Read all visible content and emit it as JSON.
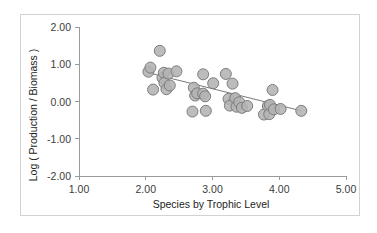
{
  "chart_data": {
    "type": "scatter",
    "title": "",
    "xlabel": "Species by Trophic Level",
    "ylabel": "Log ( Production / Biomass )",
    "xlim": [
      1.0,
      5.0
    ],
    "ylim": [
      -2.0,
      2.0
    ],
    "xticks": [
      "1.00",
      "2.00",
      "3.00",
      "4.00",
      "5.00"
    ],
    "xtick_values": [
      1.0,
      2.0,
      3.0,
      4.0,
      5.0
    ],
    "yticks": [
      "2.00",
      "1.00",
      "0.00",
      "-1.00",
      "-2.00"
    ],
    "ytick_values": [
      2.0,
      1.0,
      0.0,
      -1.0,
      -2.0
    ],
    "grid": false,
    "legend": false,
    "marker": {
      "shape": "circle",
      "fill_color": "#b3b3b3",
      "edge_color": "#7d7d7d",
      "radius_px": 5.5
    },
    "trendline": {
      "visible": true,
      "color": "#7a7a7a",
      "x_start": 2.02,
      "y_start": 0.78,
      "x_end": 4.33,
      "y_end": -0.25
    },
    "points": [
      {
        "x": 2.04,
        "y": 0.8
      },
      {
        "x": 2.07,
        "y": 0.91
      },
      {
        "x": 2.11,
        "y": 0.32
      },
      {
        "x": 2.21,
        "y": 1.36
      },
      {
        "x": 2.25,
        "y": 0.64
      },
      {
        "x": 2.27,
        "y": 0.77
      },
      {
        "x": 2.28,
        "y": 0.5
      },
      {
        "x": 2.31,
        "y": 0.33
      },
      {
        "x": 2.34,
        "y": 0.75
      },
      {
        "x": 2.36,
        "y": 0.43
      },
      {
        "x": 2.46,
        "y": 0.81
      },
      {
        "x": 2.7,
        "y": -0.27
      },
      {
        "x": 2.72,
        "y": 0.37
      },
      {
        "x": 2.74,
        "y": 0.16
      },
      {
        "x": 2.77,
        "y": 0.22
      },
      {
        "x": 2.86,
        "y": 0.73
      },
      {
        "x": 2.86,
        "y": 0.21
      },
      {
        "x": 2.89,
        "y": 0.14
      },
      {
        "x": 2.9,
        "y": -0.25
      },
      {
        "x": 3.01,
        "y": 0.49
      },
      {
        "x": 3.2,
        "y": 0.74
      },
      {
        "x": 3.24,
        "y": 0.07
      },
      {
        "x": 3.26,
        "y": -0.11
      },
      {
        "x": 3.3,
        "y": 0.48
      },
      {
        "x": 3.34,
        "y": 0.09
      },
      {
        "x": 3.36,
        "y": -0.14
      },
      {
        "x": 3.4,
        "y": -0.02
      },
      {
        "x": 3.44,
        "y": -0.17
      },
      {
        "x": 3.52,
        "y": -0.12
      },
      {
        "x": 3.77,
        "y": -0.35
      },
      {
        "x": 3.83,
        "y": -0.12
      },
      {
        "x": 3.85,
        "y": -0.34
      },
      {
        "x": 3.86,
        "y": -0.09
      },
      {
        "x": 3.9,
        "y": 0.31
      },
      {
        "x": 3.92,
        "y": -0.21
      },
      {
        "x": 4.02,
        "y": -0.2
      },
      {
        "x": 4.33,
        "y": -0.25
      }
    ]
  }
}
